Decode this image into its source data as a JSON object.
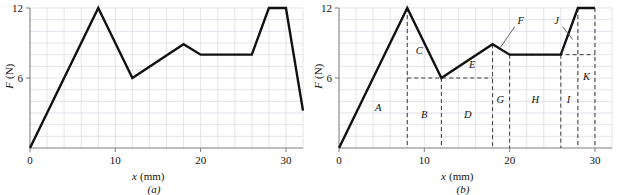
{
  "figure": {
    "panels": [
      {
        "caption": "(a)",
        "xlabel_var": "x",
        "xlabel_unit": "(mm)",
        "ylabel_var": "F",
        "ylabel_unit": "(N)",
        "xticks": [
          "0",
          "10",
          "20",
          "30"
        ],
        "yticks": [
          "6",
          "12"
        ]
      },
      {
        "caption": "(b)",
        "xlabel_var": "x",
        "xlabel_unit": "(mm)",
        "ylabel_var": "F",
        "ylabel_unit": "(N)",
        "xticks": [
          "0",
          "10",
          "20",
          "30"
        ],
        "yticks": [
          "6",
          "12"
        ]
      }
    ]
  },
  "chart_data": [
    {
      "type": "line",
      "panel": "(a)",
      "title": "",
      "xlabel": "x (mm)",
      "ylabel": "F (N)",
      "xlim": [
        0,
        32
      ],
      "ylim": [
        0,
        12
      ],
      "xticks": [
        0,
        10,
        20,
        30
      ],
      "yticks": [
        6,
        12
      ],
      "grid": true,
      "grid_minor_x_step": 2,
      "grid_minor_y_step": 1,
      "legend": "none",
      "series": [
        {
          "name": "force-displacement",
          "x": [
            0,
            8,
            12,
            18,
            20,
            26,
            28,
            30,
            32
          ],
          "y": [
            0,
            12,
            6,
            8.9,
            8,
            8,
            12,
            12,
            3.2
          ]
        }
      ]
    },
    {
      "type": "line",
      "panel": "(b)",
      "title": "",
      "xlabel": "x (mm)",
      "ylabel": "F (N)",
      "xlim": [
        0,
        32
      ],
      "ylim": [
        0,
        12
      ],
      "xticks": [
        0,
        10,
        20,
        30
      ],
      "yticks": [
        6,
        12
      ],
      "grid": true,
      "grid_minor_x_step": 2,
      "grid_minor_y_step": 1,
      "legend": "none",
      "series": [
        {
          "name": "force-displacement",
          "x": [
            0,
            8,
            12,
            18,
            20,
            26,
            28,
            30
          ],
          "y": [
            0,
            12,
            6,
            8.9,
            8,
            8,
            12,
            12
          ]
        }
      ],
      "region_labels": [
        {
          "id": "A",
          "x": 4.6,
          "y": 3.2
        },
        {
          "id": "B",
          "x": 10.0,
          "y": 2.6
        },
        {
          "id": "C",
          "x": 9.4,
          "y": 8.1
        },
        {
          "id": "D",
          "x": 15.1,
          "y": 2.6
        },
        {
          "id": "E",
          "x": 15.6,
          "y": 6.9
        },
        {
          "id": "F",
          "x": 21.3,
          "y": 10.6
        },
        {
          "id": "G",
          "x": 18.9,
          "y": 3.9
        },
        {
          "id": "H",
          "x": 23.0,
          "y": 3.9
        },
        {
          "id": "I",
          "x": 26.9,
          "y": 3.9
        },
        {
          "id": "J",
          "x": 25.5,
          "y": 10.6
        },
        {
          "id": "K",
          "x": 29.0,
          "y": 5.8
        }
      ],
      "leader_lines": [
        {
          "label": "F",
          "from_x": 20.6,
          "from_y": 10.4,
          "to_x": 18.9,
          "to_y": 8.6
        },
        {
          "label": "J",
          "from_x": 26.2,
          "from_y": 10.4,
          "to_x": 27.4,
          "to_y": 9.3
        }
      ],
      "dashed_verticals_x": [
        8,
        12,
        18,
        20,
        26,
        28,
        30
      ],
      "dashed_horizontals": [
        {
          "y": 6,
          "x_from": 8,
          "x_to": 18
        },
        {
          "y": 8,
          "x_from": 20,
          "x_to": 30
        }
      ]
    }
  ],
  "style": {
    "curve_color": "#111111",
    "grid_color": "#d8d8e4",
    "axis_color": "#8a8a8a",
    "dash_color": "#3a3a3a",
    "text_color": "#1a1a1a",
    "background": "#ffffff"
  }
}
